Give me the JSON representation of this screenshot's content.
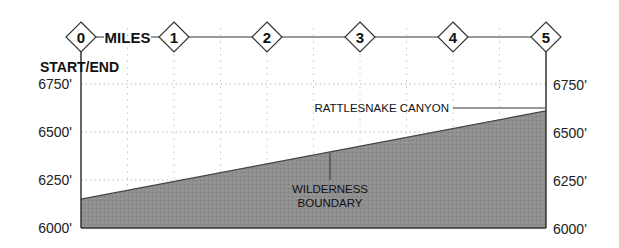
{
  "chart_data": {
    "type": "area",
    "title": "",
    "xlabel": "MILES",
    "ylabel": "",
    "x_ticks": [
      "0",
      "1",
      "2",
      "3",
      "4",
      "5"
    ],
    "xlim": [
      0,
      5
    ],
    "ylim": [
      6000,
      6750
    ],
    "y_ticks": [
      "6000'",
      "6250'",
      "6500'",
      "6750'"
    ],
    "y_tick_values": [
      6000,
      6250,
      6500,
      6750
    ],
    "grid": true,
    "series": [
      {
        "name": "Elevation profile",
        "x": [
          0,
          5
        ],
        "values": [
          6150,
          6610
        ],
        "fill": "#8e8e8e"
      }
    ],
    "annotations": [
      {
        "text": "START/END",
        "x": 0
      },
      {
        "text": "RATTLESNAKE CANYON",
        "x": 5,
        "y": 6610
      },
      {
        "text": "WILDERNESS BOUNDARY",
        "x": 2.7,
        "y": 6400
      }
    ]
  },
  "labels": {
    "miles": "MILES",
    "start_end": "START/END",
    "rattlesnake": "RATTLESNAKE CANYON",
    "wilderness_line1": "WILDERNESS",
    "wilderness_line2": "BOUNDARY"
  },
  "colors": {
    "fill": "#8e8e8e",
    "axis": "#333333",
    "grid": "#bbbbbb"
  }
}
